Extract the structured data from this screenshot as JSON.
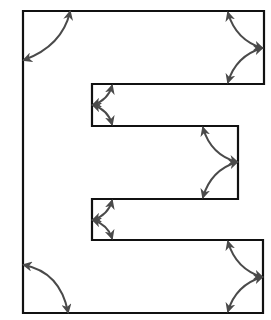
{
  "diagram": {
    "title": "",
    "shape": "letter-E",
    "colors": {
      "outline": "#111111",
      "arrows": "#4a4a4a",
      "background": "#ffffff"
    },
    "outline_points": [
      [
        23,
        11
      ],
      [
        264,
        11
      ],
      [
        264,
        84
      ],
      [
        92,
        84
      ],
      [
        92,
        126
      ],
      [
        238,
        126
      ],
      [
        238,
        199
      ],
      [
        92,
        199
      ],
      [
        92,
        240
      ],
      [
        263,
        240
      ],
      [
        263,
        313
      ],
      [
        23,
        313
      ]
    ],
    "angle_arrows": [
      {
        "id": "top-left-corner",
        "type": "single-arc",
        "arcs": [
          {
            "from": [
              70,
              12
            ],
            "to": [
              24,
              60
            ],
            "ctrl": [
              62,
              46
            ]
          }
        ]
      },
      {
        "id": "top-right-corner-pair",
        "type": "double-arc",
        "hub": [
          262,
          48
        ],
        "arcs": [
          {
            "from": [
              262,
              48
            ],
            "to": [
              228,
              13
            ],
            "ctrl": [
              236,
              40
            ]
          },
          {
            "from": [
              262,
              48
            ],
            "to": [
              228,
              82
            ],
            "ctrl": [
              236,
              56
            ]
          }
        ]
      },
      {
        "id": "upper-notch-pair",
        "type": "double-arc",
        "hub": [
          93,
          105
        ],
        "arcs": [
          {
            "from": [
              93,
              105
            ],
            "to": [
              112,
              86
            ],
            "ctrl": [
              108,
              100
            ]
          },
          {
            "from": [
              93,
              105
            ],
            "to": [
              112,
              124
            ],
            "ctrl": [
              108,
              110
            ]
          }
        ]
      },
      {
        "id": "middle-right-pair",
        "type": "double-arc",
        "hub": [
          237,
          162
        ],
        "arcs": [
          {
            "from": [
              237,
              162
            ],
            "to": [
              203,
              128
            ],
            "ctrl": [
              211,
              155
            ]
          },
          {
            "from": [
              237,
              162
            ],
            "to": [
              203,
              197
            ],
            "ctrl": [
              211,
              170
            ]
          }
        ]
      },
      {
        "id": "lower-notch-pair",
        "type": "double-arc",
        "hub": [
          93,
          220
        ],
        "arcs": [
          {
            "from": [
              93,
              220
            ],
            "to": [
              112,
              201
            ],
            "ctrl": [
              108,
              215
            ]
          },
          {
            "from": [
              93,
              220
            ],
            "to": [
              112,
              238
            ],
            "ctrl": [
              108,
              225
            ]
          }
        ]
      },
      {
        "id": "bottom-right-corner-pair",
        "type": "double-arc",
        "hub": [
          262,
          277
        ],
        "arcs": [
          {
            "from": [
              262,
              277
            ],
            "to": [
              228,
              242
            ],
            "ctrl": [
              236,
              269
            ]
          },
          {
            "from": [
              262,
              277
            ],
            "to": [
              228,
              311
            ],
            "ctrl": [
              236,
              285
            ]
          }
        ]
      },
      {
        "id": "bottom-left-corner",
        "type": "single-arc",
        "arcs": [
          {
            "from": [
              24,
              265
            ],
            "to": [
              68,
              312
            ],
            "ctrl": [
              60,
              272
            ]
          }
        ]
      }
    ]
  }
}
